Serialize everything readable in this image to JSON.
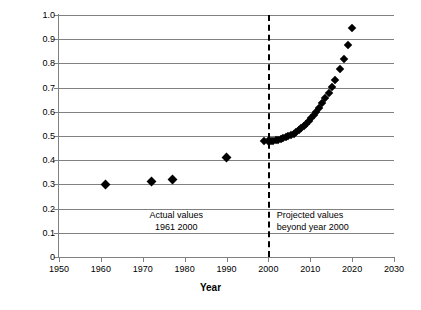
{
  "chart_data": {
    "type": "scatter",
    "title": "",
    "xlabel": "Year",
    "ylabel": "",
    "xlim": [
      1950,
      2030
    ],
    "ylim": [
      0,
      1.0
    ],
    "grid": true,
    "legend_position": "none",
    "x_ticks": [
      "1950",
      "1960",
      "1970",
      "1980",
      "1990",
      "2000",
      "2010",
      "2020",
      "2030"
    ],
    "x_tick_values": [
      1950,
      1960,
      1970,
      1980,
      1990,
      2000,
      2010,
      2020,
      2030
    ],
    "y_ticks": [
      "0",
      "0.1",
      "0.2",
      "0.3",
      "0.4",
      "0.5",
      "0.6",
      "0.7",
      "0.8",
      "0.9",
      "1.0"
    ],
    "y_tick_values": [
      0,
      0.1,
      0.2,
      0.3,
      0.4,
      0.5,
      0.6,
      0.7,
      0.8,
      0.9,
      1.0
    ],
    "annotations": [
      {
        "name": "actual-values-note",
        "line1": "Actual values",
        "line2": "1961 2000",
        "x": 1978,
        "y": 0.175
      },
      {
        "name": "projected-values-note",
        "line1": "Projected values",
        "line2": "beyond year 2000",
        "x": 2002,
        "y": 0.175
      }
    ],
    "reference_line": {
      "name": "year-2000-divider",
      "orientation": "vertical",
      "x": 2000,
      "style": "dashed"
    },
    "series": [
      {
        "name": "Actual values",
        "marker": "diamond",
        "color": "#000000",
        "points": [
          [
            1961,
            0.3
          ],
          [
            1972,
            0.31
          ],
          [
            1977,
            0.32
          ],
          [
            1990,
            0.41
          ]
        ]
      },
      {
        "name": "Projected values",
        "marker": "diamond",
        "color": "#000000",
        "points": [
          [
            1999,
            0.478
          ],
          [
            2000,
            0.479
          ],
          [
            2000.6,
            0.48
          ],
          [
            2001.2,
            0.481
          ],
          [
            2001.8,
            0.483
          ],
          [
            2002.4,
            0.485
          ],
          [
            2003,
            0.488
          ],
          [
            2003.6,
            0.491
          ],
          [
            2004.2,
            0.495
          ],
          [
            2004.8,
            0.499
          ],
          [
            2005.4,
            0.504
          ],
          [
            2006,
            0.51
          ],
          [
            2006.6,
            0.517
          ],
          [
            2007.2,
            0.524
          ],
          [
            2007.8,
            0.532
          ],
          [
            2008.4,
            0.541
          ],
          [
            2009,
            0.551
          ],
          [
            2009.6,
            0.562
          ],
          [
            2010.2,
            0.574
          ],
          [
            2010.8,
            0.587
          ],
          [
            2011.4,
            0.601
          ],
          [
            2012,
            0.616
          ],
          [
            2012.8,
            0.635
          ],
          [
            2013.6,
            0.656
          ],
          [
            2014.4,
            0.679
          ],
          [
            2015.2,
            0.704
          ],
          [
            2016,
            0.731
          ],
          [
            2017,
            0.775
          ],
          [
            2018,
            0.82
          ],
          [
            2019,
            0.875
          ],
          [
            2020,
            0.945
          ]
        ]
      }
    ]
  }
}
